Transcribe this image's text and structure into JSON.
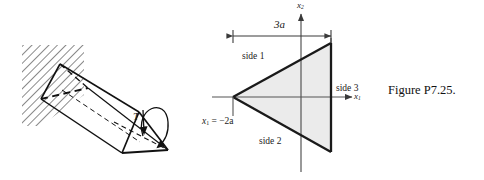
{
  "figure": {
    "caption": "Figure P7.25."
  },
  "prism_panel": {
    "name": "cantilever-prism-diagram",
    "torque_label": "T",
    "wall_hatching": "diagonal-hatch",
    "description": "triangular prism cantilevered from hatched wall with applied torque"
  },
  "cross_section_panel": {
    "name": "triangular-cross-section-diagram",
    "axes": {
      "horizontal_label": "x",
      "horizontal_subscript": "1",
      "vertical_label": "x",
      "vertical_subscript": "2"
    },
    "dimension": {
      "label": "3a",
      "value": "3a",
      "orientation": "horizontal",
      "spans": "apex to side 3"
    },
    "apex_coordinate": {
      "variable": "x",
      "subscript": "1",
      "equals": "=",
      "value": "−2a",
      "full": "x₁ = −2a"
    },
    "sides": [
      {
        "label": "side  1",
        "position": "upper-left-edge"
      },
      {
        "label": "side 2",
        "position": "lower-left-edge"
      },
      {
        "label": "side 3",
        "position": "right-vertical-edge"
      }
    ],
    "fill_color": "#ebebeb",
    "stroke_color": "#1a1a1a",
    "axis_color": "#555555"
  }
}
